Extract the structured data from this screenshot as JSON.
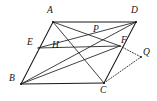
{
  "figure": {
    "width": 157,
    "height": 101,
    "background_color": "#ffffff",
    "line_color": "#1a1a1a",
    "points": [
      {
        "id": "A",
        "label": "A",
        "x": 53,
        "y": 22,
        "label_x": 47,
        "label_y": 6,
        "role": "parallelogram-vertex"
      },
      {
        "id": "D",
        "label": "D",
        "x": 136,
        "y": 22,
        "label_x": 131,
        "label_y": 6,
        "role": "parallelogram-vertex"
      },
      {
        "id": "B",
        "label": "B",
        "x": 21,
        "y": 84,
        "label_x": 9,
        "label_y": 74,
        "role": "parallelogram-vertex"
      },
      {
        "id": "C",
        "label": "C",
        "x": 104,
        "y": 83,
        "label_x": 100,
        "label_y": 86,
        "role": "parallelogram-vertex"
      },
      {
        "id": "E",
        "label": "E",
        "x": 38,
        "y": 48,
        "label_x": 27,
        "label_y": 38,
        "role": "point-on-side-AB"
      },
      {
        "id": "F",
        "label": "F",
        "x": 120,
        "y": 46,
        "label_x": 121,
        "label_y": 36,
        "role": "point-on-side-DC"
      },
      {
        "id": "P",
        "label": "P",
        "x": 97,
        "y": 38,
        "label_x": 93,
        "label_y": 25,
        "role": "intersection"
      },
      {
        "id": "H",
        "label": "H",
        "x": 58,
        "y": 55,
        "label_x": 52,
        "label_y": 41,
        "role": "intersection"
      },
      {
        "id": "Q",
        "label": "Q",
        "x": 141,
        "y": 57,
        "label_x": 143,
        "label_y": 48,
        "role": "external-point"
      }
    ],
    "segments": [
      {
        "id": "AD",
        "from": "A",
        "to": "D",
        "style": "solid",
        "name": "side-AD"
      },
      {
        "id": "BC",
        "from": "B",
        "to": "C",
        "style": "solid",
        "name": "side-BC"
      },
      {
        "id": "AB",
        "from": "A",
        "to": "B",
        "style": "solid",
        "name": "side-AB"
      },
      {
        "id": "DC",
        "from": "D",
        "to": "C",
        "style": "solid",
        "name": "side-DC"
      },
      {
        "id": "AC",
        "from": "A",
        "to": "C",
        "style": "thin",
        "name": "diagonal-AC"
      },
      {
        "id": "BD",
        "from": "B",
        "to": "D",
        "style": "thin",
        "name": "diagonal-BD"
      },
      {
        "id": "EF",
        "from": "E",
        "to": "F",
        "style": "thin",
        "name": "segment-EF"
      },
      {
        "id": "BF",
        "from": "B",
        "to": "F",
        "style": "thin",
        "name": "segment-BF"
      },
      {
        "id": "FQ",
        "from": "F",
        "to": "Q",
        "style": "dotted",
        "name": "segment-FQ"
      },
      {
        "id": "CQ",
        "from": "C",
        "to": "Q",
        "style": "dotted",
        "name": "segment-CQ"
      }
    ]
  }
}
